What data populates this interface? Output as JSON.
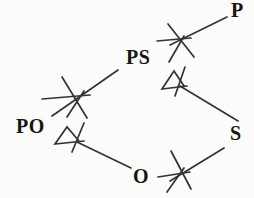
{
  "colors": {
    "background": "#fcfcfa",
    "stroke": "#333333",
    "label": "#151515"
  },
  "diagram": {
    "type": "lattice",
    "nodes": [
      {
        "id": "P",
        "label": "P",
        "x": 231,
        "y": 1
      },
      {
        "id": "PS",
        "label": "PS",
        "x": 126,
        "y": 48
      },
      {
        "id": "PO",
        "label": "PO",
        "x": 16,
        "y": 117
      },
      {
        "id": "S",
        "label": "S",
        "x": 230,
        "y": 124
      },
      {
        "id": "O",
        "label": "O",
        "x": 133,
        "y": 167
      }
    ],
    "edges": [
      {
        "from": "PS",
        "to": "P"
      },
      {
        "from": "PS",
        "to": "S"
      },
      {
        "from": "PO",
        "to": "PS"
      },
      {
        "from": "PO",
        "to": "O"
      },
      {
        "from": "O",
        "to": "S"
      }
    ],
    "strokes": [
      {
        "name": "edge-ps-p",
        "points": [
          [
            170,
            45
          ],
          [
            227,
            17
          ]
        ]
      },
      {
        "name": "edge-ps-s",
        "points": [
          [
            180,
            86
          ],
          [
            238,
            121
          ]
        ]
      },
      {
        "name": "edge-po-ps",
        "points": [
          [
            52,
            116
          ],
          [
            118,
            70
          ]
        ]
      },
      {
        "name": "edge-po-o",
        "points": [
          [
            77,
            142
          ],
          [
            131,
            168
          ]
        ]
      },
      {
        "name": "edge-o-s",
        "points": [
          [
            170,
            181
          ],
          [
            224,
            148
          ]
        ]
      },
      {
        "name": "cross-icon-p-horizontal",
        "points": [
          [
            157,
            41
          ],
          [
            191,
            38
          ]
        ]
      },
      {
        "name": "cross-icon-p-backslash",
        "points": [
          [
            168,
            24
          ],
          [
            194,
            57
          ]
        ]
      },
      {
        "name": "cross-icon-p-slash",
        "points": [
          [
            169,
            62
          ],
          [
            184,
            36
          ]
        ]
      },
      {
        "name": "cross-icon-ps-horizontal",
        "points": [
          [
            42,
            99
          ],
          [
            90,
            95
          ]
        ]
      },
      {
        "name": "cross-icon-ps-backslash",
        "points": [
          [
            62,
            77
          ],
          [
            87,
            118
          ]
        ]
      },
      {
        "name": "cross-icon-ps-slash",
        "points": [
          [
            67,
            117
          ],
          [
            84,
            91
          ]
        ]
      },
      {
        "name": "cross-icon-s-horizontal",
        "points": [
          [
            158,
            177
          ],
          [
            190,
            172
          ]
        ]
      },
      {
        "name": "cross-icon-s-backslash",
        "points": [
          [
            171,
            151
          ],
          [
            191,
            189
          ]
        ]
      },
      {
        "name": "cross-icon-s-slash",
        "points": [
          [
            167,
            192
          ],
          [
            184,
            168
          ]
        ]
      },
      {
        "name": "triangle-icon-s-outline",
        "points": [
          [
            187,
            86
          ],
          [
            162,
            89
          ],
          [
            174,
            71
          ],
          [
            184,
            86
          ]
        ]
      },
      {
        "name": "triangle-icon-s-slash",
        "points": [
          [
            185,
            67
          ],
          [
            175,
            96
          ]
        ]
      },
      {
        "name": "triangle-icon-o-outline",
        "points": [
          [
            84,
            141
          ],
          [
            55,
            144
          ],
          [
            67,
            127
          ],
          [
            79,
            141
          ]
        ]
      },
      {
        "name": "triangle-icon-o-slash",
        "points": [
          [
            84,
            123
          ],
          [
            72,
            152
          ]
        ]
      }
    ]
  }
}
